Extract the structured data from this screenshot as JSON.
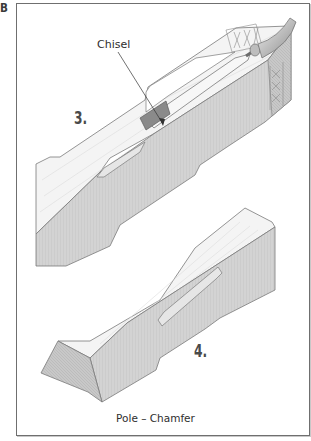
{
  "figure": {
    "label": "B",
    "caption": "Pole – Chamfer",
    "callouts": [
      {
        "text": "Chisel",
        "points_to": "chisel-blade"
      }
    ],
    "steps": [
      {
        "number": "3.",
        "description": "Chisel cutting the chamfer between stop cuts"
      },
      {
        "number": "4.",
        "description": "Finished stopped chamfer on pole"
      }
    ]
  },
  "colors": {
    "frame": "#6f6f6f",
    "wood_top": "#f4f4f4",
    "wood_side": "#d2d2d2",
    "wood_end": "#c4c4c4",
    "chisel_blade": "#8a8a8a",
    "chamfer_face": "#e6e6e6",
    "outline": "#7a7a7a"
  }
}
